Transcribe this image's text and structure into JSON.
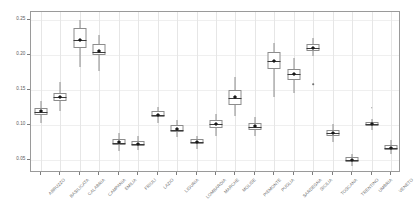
{
  "chart_data": {
    "type": "box",
    "title": "",
    "subtitle": "",
    "xlabel": "",
    "ylabel": "",
    "ylim": [
      0.032,
      0.262
    ],
    "grid": "vertical category gridlines, light horizontal gridlines",
    "legend": "none",
    "y_ticks": [
      0.05,
      0.1,
      0.15,
      0.2,
      0.25
    ],
    "y_tick_labels": [
      "0.05",
      "0.10",
      "0.15",
      "0.20",
      "0.25"
    ],
    "categories": [
      "ABRUZZO",
      "BASILICATA",
      "CALABRIA",
      "CAMPANIA",
      "EMILIA",
      "FRIULI",
      "LAZIO",
      "LIGURIA",
      "LOMBARDIA",
      "MARCHE",
      "MOLISE",
      "PIEMONTE",
      "PUGLIA",
      "SARDEGNA",
      "SICILIA",
      "TOSCANA",
      "TRENTINO",
      "UMBRIA",
      "VENETO"
    ],
    "boxes": [
      {
        "category": "ABRUZZO",
        "whisker_low": 0.104,
        "q1": 0.1155,
        "median": 0.1195,
        "q3": 0.1255,
        "whisker_high": 0.1345,
        "mean": 0.12,
        "outliers": []
      },
      {
        "category": "BASILICATA",
        "whisker_low": 0.1205,
        "q1": 0.1345,
        "median": 0.14,
        "q3": 0.146,
        "whisker_high": 0.1625,
        "mean": 0.1403,
        "outliers": []
      },
      {
        "category": "CALABRIA",
        "whisker_low": 0.1835,
        "q1": 0.2105,
        "median": 0.222,
        "q3": 0.2395,
        "whisker_high": 0.251,
        "mean": 0.2225,
        "outliers": []
      },
      {
        "category": "CAMPANIA",
        "whisker_low": 0.178,
        "q1": 0.2,
        "median": 0.2055,
        "q3": 0.2165,
        "whisker_high": 0.229,
        "mean": 0.206,
        "outliers": []
      },
      {
        "category": "EMILIA",
        "whisker_low": 0.0635,
        "q1": 0.072,
        "median": 0.0755,
        "q3": 0.08,
        "whisker_high": 0.0895,
        "mean": 0.0757,
        "outliers": []
      },
      {
        "category": "FRIULI",
        "whisker_low": 0.0655,
        "q1": 0.071,
        "median": 0.073,
        "q3": 0.0775,
        "whisker_high": 0.0855,
        "mean": 0.074,
        "outliers": []
      },
      {
        "category": "LAZIO",
        "whisker_low": 0.1035,
        "q1": 0.1115,
        "median": 0.115,
        "q3": 0.12,
        "whisker_high": 0.126,
        "mean": 0.1152,
        "outliers": []
      },
      {
        "category": "LIGURIA",
        "whisker_low": 0.083,
        "q1": 0.09,
        "median": 0.094,
        "q3": 0.1,
        "whisker_high": 0.1075,
        "mean": 0.095,
        "outliers": []
      },
      {
        "category": "LOMBARDIA",
        "whisker_low": 0.0665,
        "q1": 0.073,
        "median": 0.077,
        "q3": 0.08,
        "whisker_high": 0.0845,
        "mean": 0.077,
        "outliers": []
      },
      {
        "category": "MARCHE",
        "whisker_low": 0.0845,
        "q1": 0.0965,
        "median": 0.102,
        "q3": 0.1075,
        "whisker_high": 0.117,
        "mean": 0.1025,
        "outliers": []
      },
      {
        "category": "MOLISE",
        "whisker_low": 0.1135,
        "q1": 0.129,
        "median": 0.1385,
        "q3": 0.151,
        "whisker_high": 0.169,
        "mean": 0.1405,
        "outliers": []
      },
      {
        "category": "PIEMONTE",
        "whisker_low": 0.0855,
        "q1": 0.0935,
        "median": 0.0975,
        "q3": 0.103,
        "whisker_high": 0.112,
        "mean": 0.0985,
        "outliers": []
      },
      {
        "category": "PUGLIA",
        "whisker_low": 0.1405,
        "q1": 0.18,
        "median": 0.1915,
        "q3": 0.2055,
        "whisker_high": 0.218,
        "mean": 0.1915,
        "outliers": []
      },
      {
        "category": "SARDEGNA",
        "whisker_low": 0.1465,
        "q1": 0.1645,
        "median": 0.174,
        "q3": 0.181,
        "whisker_high": 0.1965,
        "mean": 0.173,
        "outliers": []
      },
      {
        "category": "SICILIA",
        "whisker_low": 0.1985,
        "q1": 0.206,
        "median": 0.211,
        "q3": 0.2165,
        "whisker_high": 0.2245,
        "mean": 0.211,
        "outliers": [
          0.1585
        ]
      },
      {
        "category": "TOSCANA",
        "whisker_low": 0.0765,
        "q1": 0.0855,
        "median": 0.089,
        "q3": 0.0935,
        "whisker_high": 0.1015,
        "mean": 0.0893,
        "outliers": []
      },
      {
        "category": "TRENTINO",
        "whisker_low": 0.042,
        "q1": 0.048,
        "median": 0.0505,
        "q3": 0.0545,
        "whisker_high": 0.0595,
        "mean": 0.0508,
        "outliers": []
      },
      {
        "category": "UMBRIA",
        "whisker_low": 0.093,
        "q1": 0.0985,
        "median": 0.1015,
        "q3": 0.105,
        "whisker_high": 0.1095,
        "mean": 0.1018,
        "outliers": [
          0.125
        ]
      },
      {
        "category": "VENETO",
        "whisker_low": 0.0595,
        "q1": 0.065,
        "median": 0.068,
        "q3": 0.0715,
        "whisker_high": 0.0785,
        "mean": 0.0683,
        "outliers": []
      }
    ]
  },
  "style": {
    "frame_color": "#9a9a9a",
    "box_color": "#8c8c8c",
    "median_color": "#3a3a3a",
    "mean_color": "#1a1a1a",
    "gridline_color": "#e6e6e6",
    "tick_label_color": "#5a5a5a",
    "background": "#ffffff"
  }
}
